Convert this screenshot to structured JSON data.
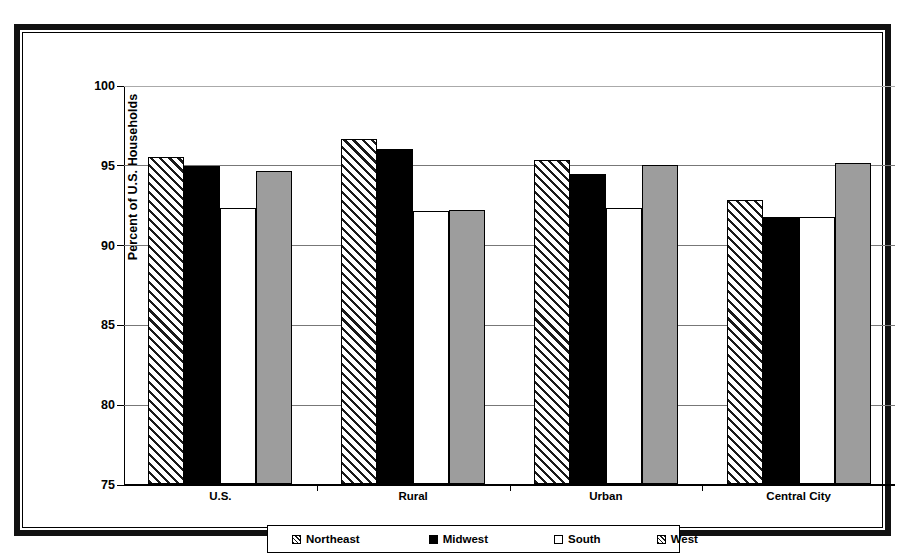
{
  "chart_data": {
    "type": "bar",
    "title": "",
    "xlabel": "",
    "ylabel": "Percent of U.S. Households",
    "ylim": [
      75,
      100
    ],
    "yticks": [
      75,
      80,
      85,
      90,
      95,
      100
    ],
    "ytick_labels": [
      "75",
      "80",
      "85",
      "90",
      "95",
      "100"
    ],
    "grid": true,
    "legend_position": "bottom",
    "categories": [
      "U.S.",
      "Rural",
      "Urban",
      "Central City"
    ],
    "series": [
      {
        "name": "Northeast",
        "fill": "hatched-diagonal",
        "color": "#ffffff",
        "values": [
          95.5,
          96.6,
          95.3,
          92.8
        ]
      },
      {
        "name": "Midwest",
        "fill": "solid",
        "color": "#000000",
        "values": [
          94.9,
          96.0,
          94.4,
          91.7
        ]
      },
      {
        "name": "South",
        "fill": "empty",
        "color": "#ffffff",
        "values": [
          92.3,
          92.1,
          92.3,
          91.7
        ]
      },
      {
        "name": "West",
        "fill": "gray",
        "color": "#9d9d9d",
        "values": [
          94.6,
          92.2,
          95.0,
          95.1
        ]
      }
    ]
  },
  "legend": {
    "items": [
      {
        "label": "Northeast",
        "swatch": "northeast"
      },
      {
        "label": "Midwest",
        "swatch": "midwest"
      },
      {
        "label": "South",
        "swatch": "south"
      },
      {
        "label": "West",
        "swatch": "west"
      }
    ]
  }
}
